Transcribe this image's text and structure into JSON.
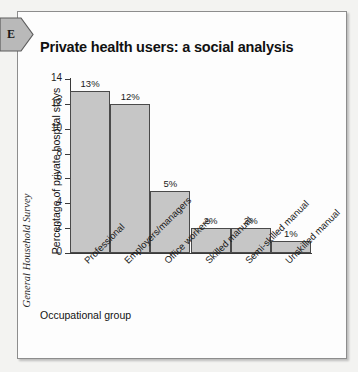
{
  "page": {
    "side_tab_letter": "E",
    "source_caption": "General Household Survey"
  },
  "chart_data": {
    "type": "bar",
    "title": "Private health users: a social analysis",
    "xlabel": "Occupational group",
    "ylabel": "Percentage of private hospital stays",
    "categories": [
      "Professional",
      "Employers/managers",
      "Office workers",
      "Skilled manual",
      "Semi-skilled manual",
      "Unskilled manual"
    ],
    "values": [
      13,
      12,
      5,
      2,
      2,
      1
    ],
    "value_labels": [
      "13%",
      "12%",
      "5%",
      "2%",
      "2%",
      "1%"
    ],
    "ylim": [
      0,
      14
    ],
    "yticks": [
      0,
      2,
      4,
      6,
      8,
      10,
      12,
      14
    ],
    "ytick_labels": [
      "0",
      "2",
      "4",
      "6",
      "8",
      "10",
      "12",
      "14"
    ],
    "grid": false,
    "legend": "none",
    "bar_color": "#c6c6c6",
    "bar_border_color": "#4a4a4a",
    "axis_color": "#3a3a3a"
  }
}
